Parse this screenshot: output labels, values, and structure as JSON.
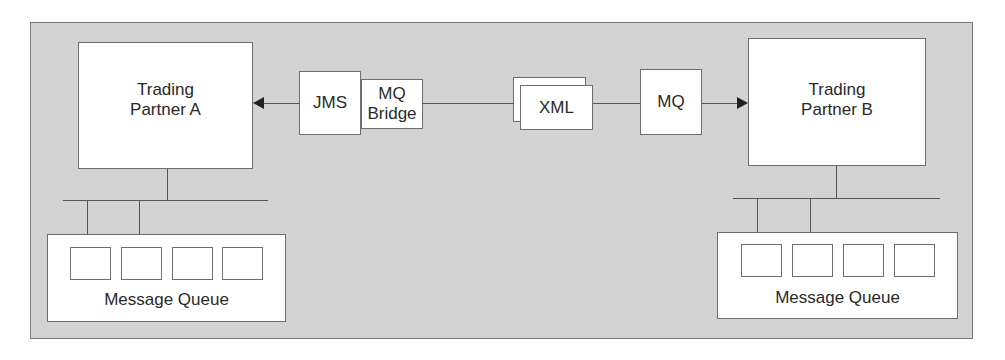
{
  "diagram": {
    "colors": {
      "panel_bg": "#d3d3d3",
      "box_bg": "#ffffff",
      "border": "#6e6e6e",
      "line": "#555555"
    },
    "nodes": {
      "partner_a": {
        "label": "Trading\nPartner A"
      },
      "partner_b": {
        "label": "Trading\nPartner B"
      },
      "jms": {
        "label": "JMS"
      },
      "mq_bridge": {
        "label": "MQ\nBridge"
      },
      "xml": {
        "label": "XML"
      },
      "mq": {
        "label": "MQ"
      },
      "queue_a": {
        "label": "Message Queue",
        "slots": 4
      },
      "queue_b": {
        "label": "Message Queue",
        "slots": 4
      }
    },
    "edges": [
      {
        "from": "jms",
        "to": "partner_a",
        "arrow": "end"
      },
      {
        "from": "mq_bridge",
        "to": "xml",
        "arrow": "none"
      },
      {
        "from": "xml",
        "to": "mq",
        "arrow": "none"
      },
      {
        "from": "mq",
        "to": "partner_b",
        "arrow": "end"
      },
      {
        "from": "partner_a",
        "to": "queue_a",
        "arrow": "none",
        "style": "bus"
      },
      {
        "from": "partner_b",
        "to": "queue_b",
        "arrow": "none",
        "style": "bus"
      }
    ]
  }
}
